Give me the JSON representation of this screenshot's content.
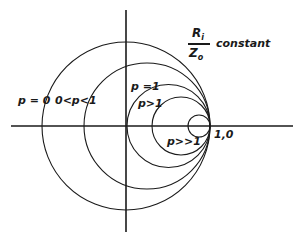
{
  "diagram": {
    "type": "constant-resistance circles",
    "colors": {
      "ink": "#1a1a1a",
      "background": "#ffffff"
    },
    "axes": {
      "horizontal": {
        "y": 126,
        "x1": 11,
        "x2": 293
      },
      "vertical": {
        "x": 126,
        "y1": 10,
        "y2": 232
      }
    },
    "tangent_point": {
      "x": 210,
      "y": 126,
      "label": "1,0"
    },
    "title": {
      "numerator": "R",
      "numerator_sub": "i",
      "denominator": "Z",
      "denominator_sub": "o",
      "suffix": "constant"
    },
    "circles": [
      {
        "name": "p-equals-0",
        "label": "p = 0",
        "cx": 126,
        "cy": 126,
        "r": 84
      },
      {
        "name": "p-between-0-1",
        "label": "0<p<1",
        "cx": 147,
        "cy": 126,
        "r": 63
      },
      {
        "name": "p-equals-1",
        "label": "p =1",
        "cx": 168.5,
        "cy": 126,
        "r": 41.5
      },
      {
        "name": "p-greater-1",
        "label": "p>1",
        "cx": 181,
        "cy": 126,
        "r": 29
      },
      {
        "name": "p-much-greater-1",
        "label": "p>>1",
        "cx": 199,
        "cy": 126,
        "r": 11
      }
    ]
  }
}
